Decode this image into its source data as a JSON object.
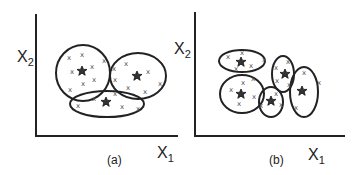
{
  "panels": [
    {
      "id": "a",
      "caption": "(a)",
      "x_axis_label": "X",
      "x_axis_sub": "1",
      "y_axis_label": "X",
      "y_axis_sub": "2",
      "clusters": 3
    },
    {
      "id": "b",
      "caption": "(b)",
      "x_axis_label": "X",
      "x_axis_sub": "1",
      "y_axis_label": "X",
      "y_axis_sub": "2",
      "clusters": 5
    }
  ],
  "marker_point": "x",
  "colors": {
    "stroke": "#222222",
    "star": "#333333",
    "point": "#555555"
  }
}
